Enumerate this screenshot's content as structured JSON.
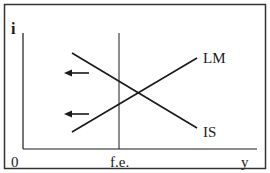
{
  "diagram": {
    "axes": {
      "y_axis_label": "i",
      "x_axis_label": "y",
      "origin_label": "0"
    },
    "markers": {
      "full_employment_label": "f.e."
    },
    "curves": [
      {
        "id": "LM",
        "label": "LM",
        "slope": "upward"
      },
      {
        "id": "IS",
        "label": "IS",
        "slope": "downward"
      }
    ],
    "shift_arrows": [
      {
        "curve": "IS",
        "direction": "left"
      },
      {
        "curve": "LM",
        "direction": "left"
      }
    ],
    "colors": {
      "line": "#1a1a1a",
      "background": "#ffffff"
    }
  }
}
